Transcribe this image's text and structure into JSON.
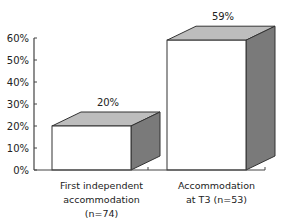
{
  "chart_data": {
    "type": "bar",
    "style": "3d",
    "title": "",
    "xlabel": "",
    "ylabel": "",
    "categories": [
      [
        "First independent",
        "accommodation",
        "(n=74)"
      ],
      [
        "Accommodation",
        "at T3 (n=53)"
      ]
    ],
    "values": [
      20,
      59
    ],
    "value_labels": [
      "20%",
      "59%"
    ],
    "ylim": [
      0,
      60
    ],
    "yticks": [
      0,
      10,
      20,
      30,
      40,
      50,
      60
    ],
    "ytick_labels": [
      "0%",
      "10%",
      "20%",
      "30%",
      "40%",
      "50%",
      "60%"
    ],
    "grid": false,
    "legend": null,
    "colors": {
      "front": "#ffffff",
      "top": "#bdbdbd",
      "side": "#7a7a7a",
      "outline": "#333333",
      "axis": "#444444"
    }
  }
}
